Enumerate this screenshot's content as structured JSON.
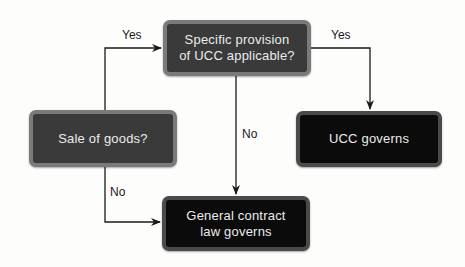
{
  "diagram": {
    "nodes": [
      {
        "id": "sale_of_goods",
        "label": "Sale of goods?"
      },
      {
        "id": "specific_provision",
        "label": "Specific provision of UCC applicable?"
      },
      {
        "id": "ucc_governs",
        "label": "UCC governs"
      },
      {
        "id": "general_contract",
        "label": "General contract law governs"
      }
    ],
    "edges": [
      {
        "from": "sale_of_goods",
        "to": "specific_provision",
        "label": "Yes"
      },
      {
        "from": "sale_of_goods",
        "to": "general_contract",
        "label": "No"
      },
      {
        "from": "specific_provision",
        "to": "ucc_governs",
        "label": "Yes"
      },
      {
        "from": "specific_provision",
        "to": "general_contract",
        "label": "No"
      }
    ]
  },
  "text": {
    "specific_line1": "Specific provision",
    "specific_line2": "of UCC applicable?",
    "sale": "Sale of goods?",
    "ucc": "UCC governs",
    "general_line1": "General contract",
    "general_line2": "law governs",
    "yes1": "Yes",
    "yes2": "Yes",
    "no1": "No",
    "no2": "No"
  },
  "colors": {
    "decision_fill": "#3a3a3a",
    "decision_border": "#7a7a7a",
    "outcome_fill": "#0b0b0b",
    "outcome_border": "#4a4a4a",
    "line": "#1a1a1a"
  }
}
